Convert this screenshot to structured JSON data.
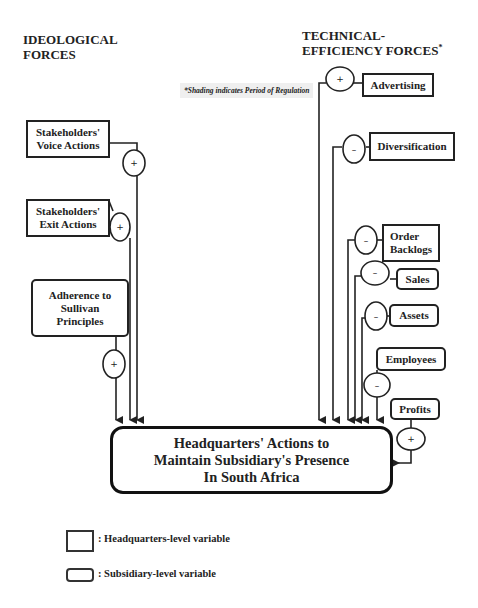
{
  "headings": {
    "ideological": [
      "IDEOLOGICAL",
      "FORCES"
    ],
    "technical": [
      "TECHNICAL-",
      "EFFICIENCY FORCES"
    ],
    "technical_marker": "*"
  },
  "note": "*Shading indicates Period of Regulation",
  "ideological_forces": [
    {
      "id": "voice",
      "lines": [
        "Stakeholders'",
        "Voice Actions"
      ],
      "level": "headquarters",
      "sign": "+"
    },
    {
      "id": "exit",
      "lines": [
        "Stakeholders'",
        "Exit Actions"
      ],
      "level": "headquarters",
      "sign": "+"
    },
    {
      "id": "sullivan",
      "lines": [
        "Adherence to",
        "Sullivan",
        "Principles"
      ],
      "level": "subsidiary",
      "sign": "+"
    }
  ],
  "technical_forces": [
    {
      "id": "advertising",
      "lines": [
        "Advertising"
      ],
      "level": "headquarters",
      "sign": "+"
    },
    {
      "id": "diversification",
      "lines": [
        "Diversification"
      ],
      "level": "headquarters",
      "sign": "–"
    },
    {
      "id": "backlogs",
      "lines": [
        "Order",
        "Backlogs"
      ],
      "level": "headquarters",
      "sign": "–"
    },
    {
      "id": "sales",
      "lines": [
        "Sales"
      ],
      "level": "subsidiary",
      "sign": "–"
    },
    {
      "id": "assets",
      "lines": [
        "Assets"
      ],
      "level": "subsidiary",
      "sign": "–"
    },
    {
      "id": "employees",
      "lines": [
        "Employees"
      ],
      "level": "subsidiary",
      "sign": "–"
    },
    {
      "id": "profits",
      "lines": [
        "Profits"
      ],
      "level": "subsidiary",
      "sign": "+"
    }
  ],
  "outcome": {
    "lines": [
      "Headquarters' Actions to",
      "Maintain Subsidiary's Presence",
      "In South Africa"
    ],
    "level": "headquarters"
  },
  "legend": [
    {
      "shape": "square-box",
      "label": ": Headquarters-level variable"
    },
    {
      "shape": "rounded-box",
      "label": ": Subsidiary-level variable"
    }
  ]
}
